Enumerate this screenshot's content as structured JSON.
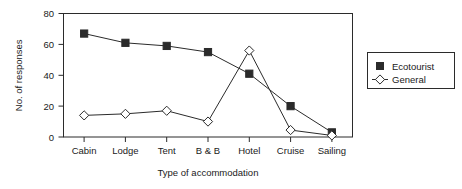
{
  "chart_data": {
    "type": "line",
    "title": "",
    "subtitle": "",
    "xlabel": "Type of accommodation",
    "ylabel": "No. of responses",
    "categories": [
      "Cabin",
      "Lodge",
      "Tent",
      "B & B",
      "Hotel",
      "Cruise",
      "Sailing"
    ],
    "ylim": [
      0,
      80
    ],
    "yticks": [
      0,
      20,
      40,
      60,
      80
    ],
    "ytick_labels": [
      "0",
      "20",
      "40",
      "60",
      "80"
    ],
    "grid": false,
    "legend_position": "right-outside",
    "series": [
      {
        "name": "Ecotourist",
        "marker": "filled-square",
        "values": [
          67,
          61,
          59,
          55,
          41,
          20,
          3
        ]
      },
      {
        "name": "General",
        "marker": "open-diamond",
        "values": [
          14,
          15,
          17,
          10,
          56,
          4.5,
          1
        ]
      }
    ],
    "colors": {
      "line": "#2b2b2b",
      "marker_fill_ecotourist": "#2b2b2b",
      "marker_fill_general": "#ffffff",
      "background": "#ffffff",
      "axis": "#2b2b2b"
    }
  },
  "legend": {
    "entries": [
      {
        "label": "Ecotourist",
        "icon": "filled-square-marker-icon"
      },
      {
        "label": "General",
        "icon": "open-diamond-marker-icon"
      }
    ]
  },
  "axes": {
    "y": {
      "title": "No. of responses",
      "tick_labels": [
        "0",
        "20",
        "40",
        "60",
        "80"
      ]
    },
    "x": {
      "title": "Type of accommodation",
      "tick_labels": [
        "Cabin",
        "Lodge",
        "Tent",
        "B & B",
        "Hotel",
        "Cruise",
        "Sailing"
      ]
    }
  }
}
